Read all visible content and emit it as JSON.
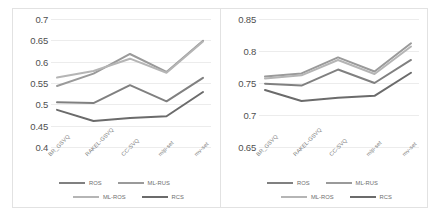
{
  "figure": {
    "background": "#ffffff",
    "panel_border": "#e2e2e2",
    "gridline_color": "#ececec"
  },
  "series_colors": {
    "ros": "#808080",
    "ml_rus": "#9a9a9a",
    "ml_ros": "#b5b5b5",
    "rcs": "#6b6b6b"
  },
  "legend": {
    "items": [
      {
        "label": "ROS",
        "color": "#808080"
      },
      {
        "label": "ML-RUS",
        "color": "#9a9a9a"
      },
      {
        "label": "ML-ROS",
        "color": "#b5b5b5"
      },
      {
        "label": "RCS",
        "color": "#6b6b6b"
      }
    ]
  },
  "chart_data": [
    {
      "type": "line",
      "title": "",
      "xlabel": "",
      "ylabel": "",
      "panel": "left",
      "grid": true,
      "legend_position": "bottom",
      "ylim": [
        0.4,
        0.7
      ],
      "yticks": [
        0.7,
        0.65,
        0.6,
        0.55,
        0.5,
        0.45,
        0.4
      ],
      "ytick_labels": [
        "0.7",
        "0.65",
        "0.6",
        "0.55",
        "0.5",
        "0.45",
        "0.4"
      ],
      "categories": [
        "BR_GSVQ",
        "RAKEL-GSVQ",
        "CC-SVQ",
        "mlp-set",
        "mv-set"
      ],
      "series": [
        {
          "name": "ROS",
          "values": [
            0.505,
            0.503,
            0.545,
            0.507,
            0.562
          ]
        },
        {
          "name": "ML-RUS",
          "values": [
            0.543,
            0.572,
            0.618,
            0.576,
            0.649
          ]
        },
        {
          "name": "ML-ROS",
          "values": [
            0.563,
            0.578,
            0.607,
            0.574,
            0.647
          ]
        },
        {
          "name": "RCS",
          "values": [
            0.487,
            0.461,
            0.468,
            0.472,
            0.529
          ]
        }
      ]
    },
    {
      "type": "line",
      "title": "",
      "xlabel": "",
      "ylabel": "",
      "panel": "right",
      "grid": true,
      "legend_position": "bottom",
      "ylim": [
        0.65,
        0.85
      ],
      "yticks": [
        0.85,
        0.8,
        0.75,
        0.7,
        0.65
      ],
      "ytick_labels": [
        "0.85",
        "0.8",
        "0.75",
        "0.7",
        "0.65"
      ],
      "categories": [
        "BR_GSVQ",
        "RAKEL-GSVQ",
        "CC-SVQ",
        "mlp-set",
        "mv-set"
      ],
      "series": [
        {
          "name": "ROS",
          "values": [
            0.749,
            0.746,
            0.771,
            0.75,
            0.786
          ]
        },
        {
          "name": "ML-RUS",
          "values": [
            0.76,
            0.765,
            0.79,
            0.768,
            0.812
          ]
        },
        {
          "name": "ML-ROS",
          "values": [
            0.757,
            0.762,
            0.786,
            0.764,
            0.807
          ]
        },
        {
          "name": "RCS",
          "values": [
            0.739,
            0.722,
            0.727,
            0.73,
            0.766
          ]
        }
      ]
    }
  ]
}
